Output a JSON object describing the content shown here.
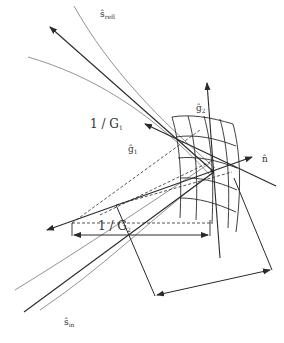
{
  "diagram": {
    "labels": {
      "s_refl": {
        "base": "ŝ",
        "sub": "refl"
      },
      "s_in": {
        "base": "ŝ",
        "sub": "in"
      },
      "g1": {
        "base": "ĝ",
        "sub": "1"
      },
      "g2": {
        "base": "ĝ",
        "sub": "2"
      },
      "n": {
        "base": "n̂"
      },
      "inv_G1": {
        "text": "1 / G",
        "sub": "1"
      },
      "inv_G2": {
        "text": "1 / G",
        "sub": "2"
      }
    },
    "colors": {
      "stroke": "#2a2a2a",
      "curve": "#666666",
      "background": "#ffffff"
    }
  }
}
